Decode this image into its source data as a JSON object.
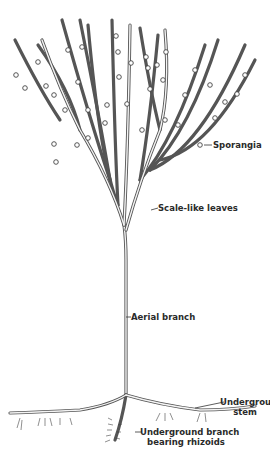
{
  "figure": {
    "labels": [
      {
        "id": "sporangia",
        "text": "Sporangia"
      },
      {
        "id": "scale_leaves",
        "text": "Scale-like leaves"
      },
      {
        "id": "aerial_branch",
        "text": "Aerial branch"
      },
      {
        "id": "underground_stem",
        "line1": "Underground",
        "line2": "stem"
      },
      {
        "id": "underground_branch",
        "line1": "Underground branch",
        "line2": "bearing rhizoids"
      }
    ],
    "colors": {
      "ink": "#444444",
      "background": "#ffffff"
    }
  }
}
